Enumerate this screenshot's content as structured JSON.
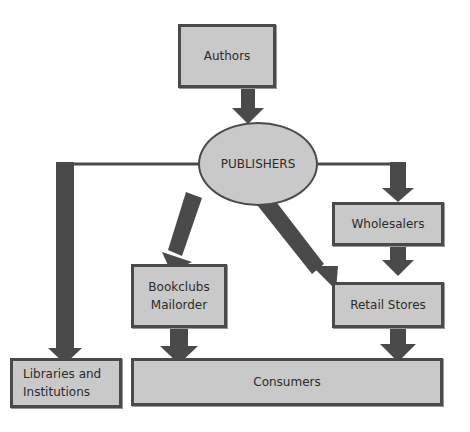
{
  "diagram": {
    "title": "",
    "colors": {
      "box_fill": "#c9c9c9",
      "border": "#4a4a4a",
      "arrow": "#4a4a4a",
      "text": "#2b2b2b"
    },
    "nodes": {
      "authors": "Authors",
      "publishers": "PUBLISHERS",
      "wholesalers": "Wholesalers",
      "retail_stores": "Retail Stores",
      "bookclubs": "Bookclubs\nMailorder",
      "libraries": "Libraries and\nInstitutions",
      "consumers": "Consumers"
    },
    "edges": [
      {
        "from": "Authors",
        "to": "PUBLISHERS"
      },
      {
        "from": "PUBLISHERS",
        "to": "Libraries and Institutions"
      },
      {
        "from": "PUBLISHERS",
        "to": "Bookclubs Mailorder"
      },
      {
        "from": "PUBLISHERS",
        "to": "Retail Stores"
      },
      {
        "from": "PUBLISHERS",
        "to": "Wholesalers"
      },
      {
        "from": "Wholesalers",
        "to": "Retail Stores"
      },
      {
        "from": "Bookclubs Mailorder",
        "to": "Consumers"
      },
      {
        "from": "Retail Stores",
        "to": "Consumers"
      }
    ]
  }
}
